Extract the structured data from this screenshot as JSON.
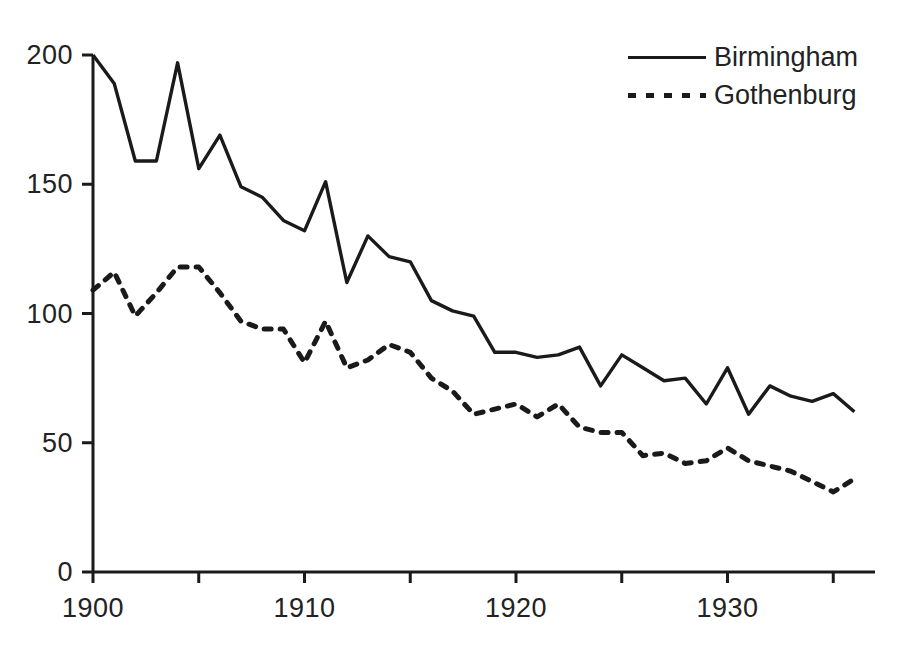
{
  "chart_data": {
    "type": "line",
    "title": "",
    "xlabel": "",
    "ylabel": "",
    "xlim": [
      1900,
      1936
    ],
    "ylim": [
      0,
      200
    ],
    "grid": false,
    "legend_position": "top-right",
    "x_ticks": [
      1900,
      1910,
      1920,
      1930
    ],
    "x_minor_ticks": [
      1905,
      1915,
      1925,
      1935
    ],
    "y_ticks": [
      0,
      50,
      100,
      150,
      200
    ],
    "x": [
      1900,
      1901,
      1902,
      1903,
      1904,
      1905,
      1906,
      1907,
      1908,
      1909,
      1910,
      1911,
      1912,
      1913,
      1914,
      1915,
      1916,
      1917,
      1918,
      1919,
      1920,
      1921,
      1922,
      1923,
      1924,
      1925,
      1926,
      1927,
      1928,
      1929,
      1930,
      1931,
      1932,
      1933,
      1934,
      1935,
      1936
    ],
    "series": [
      {
        "name": "Birmingham",
        "style": "solid",
        "color": "#1a1a1a",
        "values": [
          200,
          189,
          159,
          159,
          197,
          156,
          169,
          149,
          145,
          136,
          132,
          151,
          112,
          130,
          122,
          120,
          105,
          101,
          99,
          85,
          85,
          83,
          84,
          87,
          72,
          84,
          79,
          74,
          75,
          65,
          79,
          61,
          72,
          68,
          66,
          69,
          62
        ]
      },
      {
        "name": "Gothenburg",
        "style": "dotted",
        "color": "#1a1a1a",
        "values": [
          109,
          116,
          99,
          108,
          118,
          118,
          108,
          97,
          94,
          94,
          81,
          97,
          79,
          82,
          88,
          85,
          75,
          70,
          61,
          63,
          65,
          60,
          65,
          56,
          54,
          54,
          45,
          46,
          42,
          43,
          48,
          43,
          41,
          39,
          35,
          31,
          36
        ]
      }
    ]
  },
  "legend": {
    "entries": [
      {
        "label": "Birmingham",
        "style": "solid"
      },
      {
        "label": "Gothenburg",
        "style": "dotted"
      }
    ]
  },
  "axes": {
    "y_tick_labels": [
      "200",
      "150",
      "100",
      "50",
      "0"
    ],
    "x_tick_labels": [
      "1900",
      "1910",
      "1920",
      "1930"
    ]
  }
}
